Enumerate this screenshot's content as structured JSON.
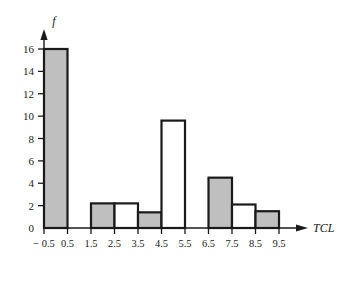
{
  "chart_data": {
    "type": "bar",
    "title": "",
    "subtitle": "",
    "xlabel": "TCL",
    "ylabel": "f",
    "grid": false,
    "legend": null,
    "xlim": [
      -0.5,
      9.5
    ],
    "ylim": [
      0,
      16
    ],
    "x_tick_labels": [
      "− 0.5",
      "0.5",
      "1.5",
      "2.5",
      "3.5",
      "4.5",
      "5.5",
      "6.5",
      "7.5",
      "8.5",
      "9.5"
    ],
    "x_tick_values": [
      -0.5,
      0.5,
      1.5,
      2.5,
      3.5,
      4.5,
      5.5,
      6.5,
      7.5,
      8.5,
      9.5
    ],
    "y_tick_labels": [
      "0",
      "2",
      "4",
      "6",
      "8",
      "10",
      "12",
      "14",
      "16"
    ],
    "y_tick_values": [
      0,
      2,
      4,
      6,
      8,
      10,
      12,
      14,
      16
    ],
    "bin_width": 1,
    "categories": [
      "-0.5 to 0.5",
      "0.5 to 1.5",
      "1.5 to 2.5",
      "2.5 to 3.5",
      "3.5 to 4.5",
      "4.5 to 5.5",
      "5.5 to 6.5",
      "6.5 to 7.5",
      "7.5 to 8.5",
      "8.5 to 9.5"
    ],
    "values": [
      16,
      0,
      2.2,
      2.2,
      1.4,
      9.6,
      0,
      4.5,
      2.1,
      1.5
    ],
    "bars": [
      {
        "label": "-0.5 to 0.5",
        "x0": -0.5,
        "x1": 0.5,
        "value": 16,
        "fill": "#bfbfbf"
      },
      {
        "label": "0.5 to 1.5",
        "x0": 0.5,
        "x1": 1.5,
        "value": 0,
        "fill": "#ffffff"
      },
      {
        "label": "1.5 to 2.5",
        "x0": 1.5,
        "x1": 2.5,
        "value": 2.2,
        "fill": "#bfbfbf"
      },
      {
        "label": "2.5 to 3.5",
        "x0": 2.5,
        "x1": 3.5,
        "value": 2.2,
        "fill": "#ffffff"
      },
      {
        "label": "3.5 to 4.5",
        "x0": 3.5,
        "x1": 4.5,
        "value": 1.4,
        "fill": "#bfbfbf"
      },
      {
        "label": "4.5 to 5.5",
        "x0": 4.5,
        "x1": 5.5,
        "value": 9.6,
        "fill": "#ffffff"
      },
      {
        "label": "5.5 to 6.5",
        "x0": 5.5,
        "x1": 6.5,
        "value": 0,
        "fill": "#ffffff"
      },
      {
        "label": "6.5 to 7.5",
        "x0": 6.5,
        "x1": 7.5,
        "value": 4.5,
        "fill": "#bfbfbf"
      },
      {
        "label": "7.5 to 8.5",
        "x0": 7.5,
        "x1": 8.5,
        "value": 2.1,
        "fill": "#ffffff"
      },
      {
        "label": "8.5 to 9.5",
        "x0": 8.5,
        "x1": 9.5,
        "value": 1.5,
        "fill": "#bfbfbf"
      }
    ],
    "colors": {
      "bar_fill_shaded": "#bfbfbf",
      "bar_fill_unshaded": "#ffffff",
      "bar_stroke": "#1a1a1a",
      "axis": "#1a1a1a",
      "background": "#ffffff"
    }
  }
}
